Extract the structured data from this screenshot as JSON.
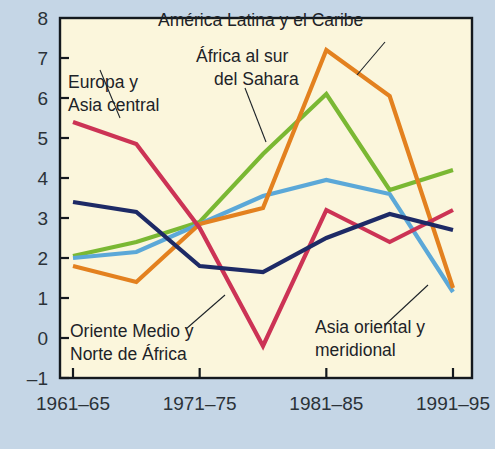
{
  "figure": {
    "background_color": "#c5d6e6",
    "plot_background_color": "#fbf6dc",
    "axis_color": "#14191e",
    "text_color": "#2b3238"
  },
  "chart_data": {
    "type": "line",
    "title": "",
    "subtitle": "",
    "xlabel": "",
    "ylabel": "",
    "grid": false,
    "legend_position": "inline-annotations",
    "categories": [
      "1961–65",
      "1966–70",
      "1971–75",
      "1976–80",
      "1981–85",
      "1986–90",
      "1991–95"
    ],
    "x_tick_labels": [
      "1961–65",
      "1971–75",
      "1981–85",
      "1991–95"
    ],
    "x_tick_indices": [
      0,
      2,
      4,
      6
    ],
    "y_tick_labels": [
      "8",
      "7",
      "6",
      "5",
      "4",
      "3",
      "2",
      "1",
      "0",
      "–1"
    ],
    "y_tick_values": [
      8,
      7,
      6,
      5,
      4,
      3,
      2,
      1,
      0,
      -1
    ],
    "ylim": [
      -1,
      8
    ],
    "series": [
      {
        "name": "Europa y Asia central",
        "color": "#cc3355",
        "values": [
          5.4,
          4.85,
          2.75,
          -0.2,
          3.2,
          2.4,
          3.2
        ]
      },
      {
        "name": "África al sur del Sahara",
        "color": "#7ab833",
        "values": [
          2.05,
          2.4,
          2.9,
          4.6,
          6.1,
          3.7,
          4.2
        ]
      },
      {
        "name": "América Latina y el Caribe",
        "color": "#e3811f",
        "values": [
          1.8,
          1.4,
          2.85,
          3.25,
          7.2,
          6.05,
          1.25
        ]
      },
      {
        "name": "Asia oriental y meridional",
        "color": "#5ba8d8",
        "values": [
          2.0,
          2.15,
          2.85,
          3.55,
          3.95,
          3.6,
          1.15
        ]
      },
      {
        "name": "Oriente Medio y Norte de África",
        "color": "#1d2a66",
        "values": [
          3.4,
          3.15,
          1.8,
          1.65,
          2.5,
          3.1,
          2.7
        ]
      }
    ],
    "annotations": [
      {
        "id": "europa-asia-central",
        "lines": [
          "Europa y",
          "Asia central"
        ],
        "text_x": 68,
        "text_y": 88,
        "leader_from": [
          120,
          118
        ],
        "leader_to": [
          100,
          70
        ]
      },
      {
        "id": "africa-sur-sahara",
        "lines": [
          "África al sur",
          "del Sahara"
        ],
        "text_x": 196,
        "text_y": 62,
        "leader_from": [
          266,
          142
        ],
        "leader_to": [
          245,
          88
        ]
      },
      {
        "id": "america-latina-caribe",
        "lines": [
          "América Latina y el Caribe"
        ],
        "text_x": 158,
        "text_y": 26,
        "leader_from": [
          357,
          75
        ],
        "leader_to": [
          385,
          42
        ]
      },
      {
        "id": "oriente-medio-norte-africa",
        "lines": [
          "Oriente Medio y",
          "Norte de África"
        ],
        "text_x": 70,
        "text_y": 337,
        "leader_from": [
          186,
          329
        ],
        "leader_to": [
          225,
          295
        ]
      },
      {
        "id": "asia-oriental-meridional",
        "lines": [
          "Asia oriental y",
          "meridional"
        ],
        "text_x": 315,
        "text_y": 333,
        "leader_from": [
          385,
          325
        ],
        "leader_to": [
          428,
          285
        ]
      }
    ]
  }
}
